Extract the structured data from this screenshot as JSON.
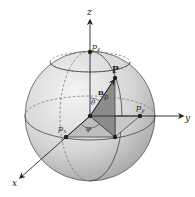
{
  "diagram": {
    "type": "sphere-coordinate-diagram",
    "axes": {
      "x": {
        "label": "x"
      },
      "y": {
        "label": "y"
      },
      "z": {
        "label": "z"
      }
    },
    "points": {
      "P": {
        "label": "P"
      },
      "px": {
        "label": "p",
        "sub": "x"
      },
      "py": {
        "label": "p",
        "sub": "y"
      },
      "pz": {
        "label": "p",
        "sub": "z"
      }
    },
    "vector_label": "n",
    "radius_label": "p",
    "angles": {
      "theta": "θ",
      "phi": "φ"
    },
    "colors": {
      "sphere_light": "#f2f2f2",
      "sphere_dark": "#a9a9a9",
      "vertical_triangle": "#8c8c8c",
      "horizontal_triangle": "#bdbdbd",
      "line": "#333333"
    }
  }
}
